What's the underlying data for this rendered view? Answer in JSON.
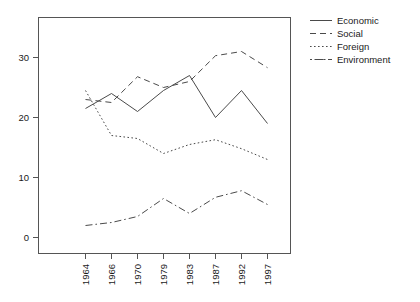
{
  "chart_data": {
    "type": "line",
    "title": "",
    "subtitle": "",
    "xlabel": "",
    "ylabel": "",
    "categories": [
      "1964",
      "1966",
      "1970",
      "1979",
      "1983",
      "1987",
      "1992",
      "1997"
    ],
    "x_tick_labels": [
      "1964",
      "1966",
      "1970",
      "1979",
      "1983",
      "1987",
      "1992",
      "1997"
    ],
    "x_tick_rotation": 90,
    "y_tick_labels": [
      "0",
      "10",
      "20",
      "30"
    ],
    "y_ticks": [
      0,
      10,
      20,
      30
    ],
    "ylim": [
      -1.5,
      36
    ],
    "xlim": [
      0,
      9
    ],
    "grid": false,
    "legend_position": "right",
    "series": [
      {
        "name": "Economic",
        "style": "solid",
        "values": [
          21.5,
          24.0,
          21.0,
          24.5,
          27.0,
          20.0,
          24.5,
          19.0
        ]
      },
      {
        "name": "Social",
        "style": "dashed",
        "values": [
          23.0,
          22.5,
          26.8,
          25.0,
          26.0,
          30.3,
          31.0,
          28.3
        ]
      },
      {
        "name": "Foreign",
        "style": "dotted",
        "values": [
          24.5,
          17.0,
          16.5,
          14.0,
          15.5,
          16.3,
          14.8,
          13.0
        ]
      },
      {
        "name": "Environment",
        "style": "dashdot",
        "values": [
          2.0,
          2.5,
          3.5,
          6.5,
          4.0,
          6.7,
          7.8,
          5.5
        ]
      }
    ]
  },
  "legend": {
    "entries": [
      {
        "label": "Economic"
      },
      {
        "label": "Social"
      },
      {
        "label": "Foreign"
      },
      {
        "label": "Environment"
      }
    ]
  },
  "colors": {
    "line": "#4a4a4a",
    "axis": "#555555",
    "text": "#1a1a1a",
    "background": "#ffffff"
  }
}
